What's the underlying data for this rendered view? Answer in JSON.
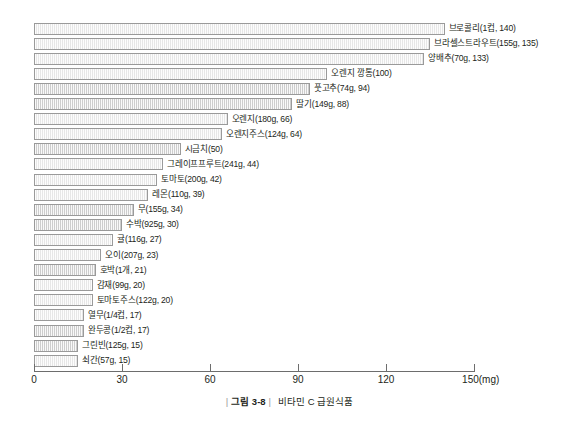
{
  "caption": {
    "rule_left": "|",
    "number": "그림 3-8",
    "rule_right": "|",
    "title": "비타민 C 급원식품"
  },
  "axis": {
    "unit_suffix": "(mg)",
    "ticks": [
      "0",
      "30",
      "60",
      "90",
      "120",
      "150(mg)"
    ]
  },
  "chart_data": {
    "type": "bar",
    "orientation": "horizontal",
    "title": "비타민 C 급원식품",
    "xlabel": "(mg)",
    "ylabel": "",
    "xlim": [
      0,
      150
    ],
    "xticks": [
      0,
      30,
      60,
      90,
      120,
      150
    ],
    "grid": false,
    "legend": null,
    "categories": [
      "브로콜리(1컵)",
      "브라셀스트라우트(155g)",
      "양배추(70g)",
      "오렌지 깡통",
      "풋고추(74g)",
      "딸기(149g)",
      "오렌지(180g)",
      "오렌지주스(124g)",
      "시금치",
      "그레이프프루트(241g)",
      "토마토(200g)",
      "레몬(110g)",
      "무(155g)",
      "수박(925g)",
      "귤(116g)",
      "오이(207g)",
      "호박(1개)",
      "감재(99g)",
      "토마토주스(122g)",
      "열무(1/4컵)",
      "완두콩(1/2컵)",
      "그린빈(125g)",
      "쇠간(57g)"
    ],
    "values": [
      140,
      135,
      133,
      100,
      94,
      88,
      66,
      64,
      50,
      44,
      42,
      39,
      34,
      30,
      27,
      23,
      21,
      20,
      20,
      17,
      17,
      15,
      15
    ],
    "data_labels": [
      "브로콜리(1컵, 140)",
      "브라셀스트라우트(155g, 135)",
      "양배추(70g, 133)",
      "오렌지 깡통(100)",
      "풋고추(74g, 94)",
      "딸기(149g, 88)",
      "오렌지(180g, 66)",
      "오렌지주스(124g, 64)",
      "시금치(50)",
      "그레이프프루트(241g, 44)",
      "토마토(200g, 42)",
      "레몬(110g, 39)",
      "무(155g, 34)",
      "수박(925g, 30)",
      "귤(116g, 27)",
      "오이(207g, 23)",
      "호박(1개, 21)",
      "감재(99g, 20)",
      "토마토주스(122g, 20)",
      "열무(1/4컵, 17)",
      "완두콩(1/2컵, 17)",
      "그린빈(125g, 15)",
      "쇠간(57g, 15)"
    ],
    "bar_shades": [
      "light",
      "light",
      "light",
      "light",
      "dark",
      "dark",
      "light",
      "light",
      "dark",
      "light",
      "light",
      "light",
      "dark",
      "dark",
      "light",
      "light",
      "dark",
      "light",
      "light",
      "light",
      "dark",
      "dark",
      "light"
    ],
    "colors": {
      "bar_light": "#efefef",
      "bar_dark": "#d4d4d4",
      "bar_border": "#9a9a9a",
      "axis": "#6d6d6d",
      "text": "#231f20"
    }
  }
}
